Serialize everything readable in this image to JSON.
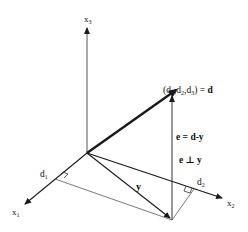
{
  "diagram": {
    "axes": [
      {
        "id": "x1",
        "label": "x",
        "sub": "1"
      },
      {
        "id": "x2",
        "label": "x",
        "sub": "2"
      },
      {
        "id": "x3",
        "label": "x",
        "sub": "3"
      }
    ],
    "point_label": {
      "open": "(d",
      "s1": "1",
      "c1": ",d",
      "s2": "2",
      "c2": ",d",
      "s3": "3",
      "close": ") = ",
      "vec": "d"
    },
    "components": {
      "d1": {
        "label": "d",
        "sub": "1"
      },
      "d2": {
        "label": "d",
        "sub": "2"
      }
    },
    "vectors": {
      "y": "y",
      "e_def": "e = d-y",
      "e_perp": "e ⊥ y"
    },
    "colors": {
      "line": "#1a1a1a",
      "thin_line": "#444444",
      "background": "#ffffff"
    }
  }
}
